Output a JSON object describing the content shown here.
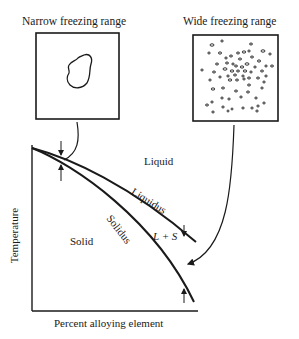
{
  "panels": {
    "narrow": {
      "title": "Narrow freezing range"
    },
    "wide": {
      "title": "Wide freezing range"
    }
  },
  "diagram": {
    "region_labels": {
      "liquid": "Liquid",
      "solid": "Solid",
      "mushy": "L + S"
    },
    "curve_labels": {
      "liquidus": "Liquidus",
      "solidus": "Solidus"
    },
    "axes": {
      "y_label": "Temperature",
      "x_label": "Percent alloying element"
    }
  },
  "colors": {
    "ink": "#1a1a1a",
    "background": "#ffffff"
  }
}
